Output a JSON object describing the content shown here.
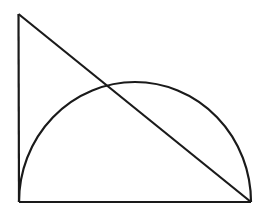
{
  "figure": {
    "stroke_color": "#1a1a1a",
    "background": "#ffffff",
    "stroke_width": 2.2
  },
  "shapes": {
    "triangle": {
      "vertices": [
        [
          18,
          14
        ],
        [
          19,
          202
        ],
        [
          251,
          202
        ]
      ]
    },
    "semicircle": {
      "left": [
        19,
        202
      ],
      "right": [
        251,
        202
      ],
      "center": [
        135,
        202
      ],
      "rx": 116,
      "ry": 120
    }
  }
}
